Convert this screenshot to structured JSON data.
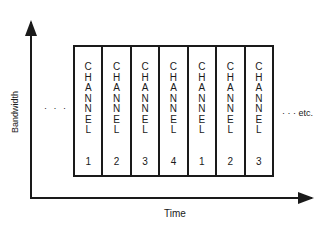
{
  "diagram": {
    "type": "time-division-multiplexing",
    "y_axis_label": "Bandwidth",
    "x_axis_label": "Time",
    "leading_ellipsis": "· · ·",
    "trailing_text": "· · · etc.",
    "slots": [
      {
        "letters": [
          "C",
          "H",
          "A",
          "N",
          "N",
          "E",
          "L"
        ],
        "number": "1"
      },
      {
        "letters": [
          "C",
          "H",
          "A",
          "N",
          "N",
          "E",
          "L"
        ],
        "number": "2"
      },
      {
        "letters": [
          "C",
          "H",
          "A",
          "N",
          "N",
          "E",
          "L"
        ],
        "number": "3"
      },
      {
        "letters": [
          "C",
          "H",
          "A",
          "N",
          "N",
          "E",
          "L"
        ],
        "number": "4"
      },
      {
        "letters": [
          "C",
          "H",
          "A",
          "N",
          "N",
          "E",
          "L"
        ],
        "number": "1"
      },
      {
        "letters": [
          "C",
          "H",
          "A",
          "N",
          "N",
          "E",
          "L"
        ],
        "number": "2"
      },
      {
        "letters": [
          "C",
          "H",
          "A",
          "N",
          "N",
          "E",
          "L"
        ],
        "number": "3"
      }
    ]
  },
  "colors": {
    "ink": "#1a1a1a",
    "background": "#ffffff"
  }
}
